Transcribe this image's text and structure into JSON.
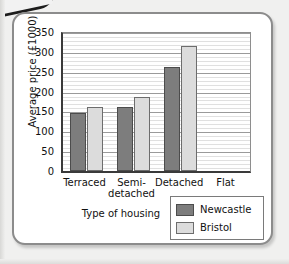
{
  "chart_data": {
    "type": "bar",
    "title": "",
    "xlabel": "Type of housing",
    "ylabel": "Average price (£1000)",
    "categories": [
      "Terraced",
      "Semi-detached",
      "Detached",
      "Flat"
    ],
    "category_lines": [
      [
        "Terraced"
      ],
      [
        "Semi-",
        "detached"
      ],
      [
        "Detached"
      ],
      [
        "Flat"
      ]
    ],
    "series": [
      {
        "name": "Newcastle",
        "color": "#7d7d7d",
        "values": [
          147,
          161,
          262,
          null
        ]
      },
      {
        "name": "Bristol",
        "color": "#dcdcdc",
        "values": [
          160,
          186,
          315,
          null
        ]
      }
    ],
    "ylim": [
      0,
      350
    ],
    "ytick_labels": [
      "350",
      "300",
      "250",
      "200",
      "150",
      "100",
      "50",
      "0"
    ],
    "ytick_values": [
      350,
      300,
      250,
      200,
      150,
      100,
      50,
      0
    ],
    "ytick_step": 50,
    "minor_gridline_step": 10,
    "grid": true,
    "legend_position": "bottom-right",
    "note_flat_empty": "Flat category has no bars drawn"
  },
  "legend": {
    "entries": [
      {
        "label": "Newcastle"
      },
      {
        "label": "Bristol"
      }
    ]
  }
}
